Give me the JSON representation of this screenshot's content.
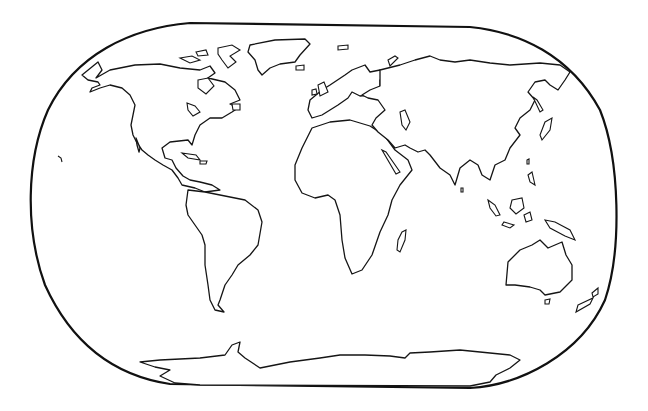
{
  "map": {
    "type": "blank outline world map",
    "projection": "rounded-rectangle (Robinson-like) frame",
    "colors": {
      "background": "#ffffff",
      "outline": "#151515"
    },
    "labels": [],
    "features": [
      "North America",
      "Greenland",
      "South America",
      "Europe",
      "Africa",
      "Madagascar",
      "Asia",
      "Japan",
      "Maritime Southeast Asia",
      "Australia",
      "New Zealand",
      "Antarctica"
    ]
  }
}
